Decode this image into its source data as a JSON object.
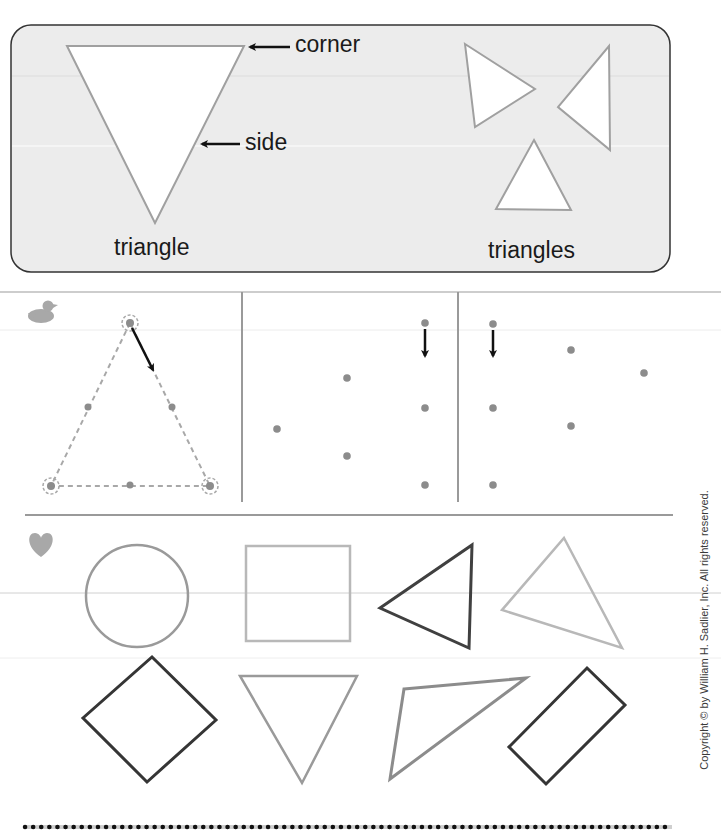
{
  "intro_panel": {
    "labels": {
      "corner": "corner",
      "side": "side",
      "triangle": "triangle",
      "triangles": "triangles"
    }
  },
  "section_icons": {
    "tracing_section": "duck-icon",
    "identify_section": "heart-icon"
  },
  "tracing_section": {
    "panels": [
      {
        "name": "traced-triangle-example",
        "dots": 6,
        "start_arrow": "diagonal-down-right"
      },
      {
        "name": "dot-triangle-1",
        "dots": 6,
        "start_arrow": "down"
      },
      {
        "name": "dot-triangle-2",
        "dots": 6,
        "start_arrow": "down"
      }
    ]
  },
  "identify_section": {
    "shapes_row_1": [
      "circle",
      "square",
      "triangle",
      "triangle"
    ],
    "shapes_row_2": [
      "diamond-square",
      "triangle",
      "triangle",
      "rectangle"
    ]
  },
  "colors": {
    "panel_bg": "#ececec",
    "panel_border": "#333333",
    "shape_gray": "#9a9a9a",
    "shape_dark": "#404040",
    "dot_gray": "#8c8c8c",
    "icon_gray": "#a8a8a8"
  },
  "footer": {
    "copyright": "Copyright © by William H. Sadlier, Inc. All rights reserved."
  }
}
